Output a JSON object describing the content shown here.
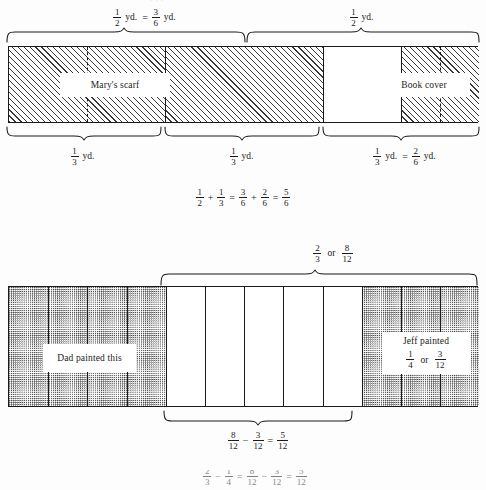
{
  "page": {
    "kind": "textbook-figure-page",
    "background": "#fdfdfd",
    "ink": "#1c1c1c"
  },
  "figure1": {
    "name": "addition-of-fractions-bar",
    "top_labels": [
      {
        "id": "half-equals-three-sixths",
        "parts": [
          "1/2",
          "yd.",
          "=",
          "3/6",
          "yd."
        ],
        "num1": "1",
        "den1": "2",
        "unit1": "yd.",
        "equals": "=",
        "num2": "3",
        "den2": "6",
        "unit2": "yd."
      },
      {
        "id": "one-half",
        "num": "1",
        "den": "2",
        "unit": "yd."
      }
    ],
    "bottom_labels": [
      {
        "id": "one-third-left",
        "num": "1",
        "den": "3",
        "unit": "yd."
      },
      {
        "id": "one-third-middle",
        "num": "1",
        "den": "3",
        "unit": "yd."
      },
      {
        "id": "one-third-equals-two-sixths",
        "num1": "1",
        "den1": "3",
        "unit1": "yd.",
        "equals": "=",
        "num2": "2",
        "den2": "6",
        "unit2": "yd."
      }
    ],
    "callouts": [
      {
        "id": "marys-scarf",
        "text": "Mary's scarf"
      },
      {
        "id": "book-cover",
        "text": "Book cover"
      }
    ],
    "equation": {
      "id": "half-plus-third",
      "terms": [
        {
          "num": "1",
          "den": "2"
        },
        {
          "op": "+"
        },
        {
          "num": "1",
          "den": "3"
        },
        {
          "op": "="
        },
        {
          "num": "3",
          "den": "6"
        },
        {
          "op": "+"
        },
        {
          "num": "2",
          "den": "6"
        },
        {
          "op": "="
        },
        {
          "num": "5",
          "den": "6"
        }
      ]
    }
  },
  "figure2": {
    "name": "subtraction-of-fractions-bar",
    "top_label": {
      "id": "two-thirds-or-eight-twelfths",
      "num1": "2",
      "den1": "3",
      "or": "or",
      "num2": "8",
      "den2": "12"
    },
    "callouts": [
      {
        "id": "dad-painted-this",
        "text": "Dad painted this"
      },
      {
        "id": "jeff-painted",
        "text": "Jeff painted",
        "num1": "1",
        "den1": "4",
        "or": "or",
        "num2": "3",
        "den2": "12"
      }
    ],
    "bottom_brace_equation": {
      "id": "eight-twelfths-minus-three-twelfths",
      "terms": [
        {
          "num": "8",
          "den": "12"
        },
        {
          "op": "−"
        },
        {
          "num": "3",
          "den": "12"
        },
        {
          "op": "="
        },
        {
          "num": "5",
          "den": "12"
        }
      ]
    },
    "equation": {
      "id": "two-thirds-minus-one-fourth",
      "terms": [
        {
          "num": "2",
          "den": "3"
        },
        {
          "op": "−"
        },
        {
          "num": "1",
          "den": "4"
        },
        {
          "op": "="
        },
        {
          "num": "8",
          "den": "12"
        },
        {
          "op": "−"
        },
        {
          "num": "3",
          "den": "12"
        },
        {
          "op": "="
        },
        {
          "num": "5",
          "den": "12"
        }
      ]
    }
  },
  "clipped_top_line": {
    "id": "clipped-running-text",
    "text": "· · ·"
  }
}
